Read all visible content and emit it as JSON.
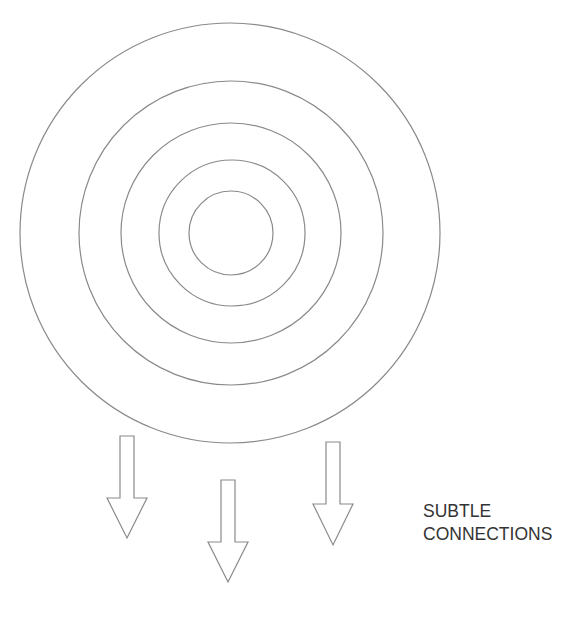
{
  "diagram": {
    "rings": {
      "center": [
        231,
        233
      ],
      "radii": [
        42,
        73,
        110,
        152,
        210
      ],
      "stroke": "#8a8a8a"
    },
    "arrows": [
      {
        "id": "arrow-left",
        "direction": "down",
        "shaft_x": [
          120,
          134
        ],
        "top": 436,
        "head_y": 498,
        "head_x": [
          107,
          147
        ],
        "tip": [
          127,
          538
        ]
      },
      {
        "id": "arrow-middle",
        "direction": "down",
        "shaft_x": [
          221,
          235
        ],
        "top": 480,
        "head_y": 542,
        "head_x": [
          208,
          248
        ],
        "tip": [
          228,
          582
        ]
      },
      {
        "id": "arrow-right",
        "direction": "down",
        "shaft_x": [
          326,
          340
        ],
        "top": 442,
        "head_y": 504,
        "head_x": [
          313,
          353
        ],
        "tip": [
          333,
          545
        ]
      }
    ],
    "label": {
      "line1": "SUBTLE",
      "line2": "CONNECTIONS"
    }
  }
}
